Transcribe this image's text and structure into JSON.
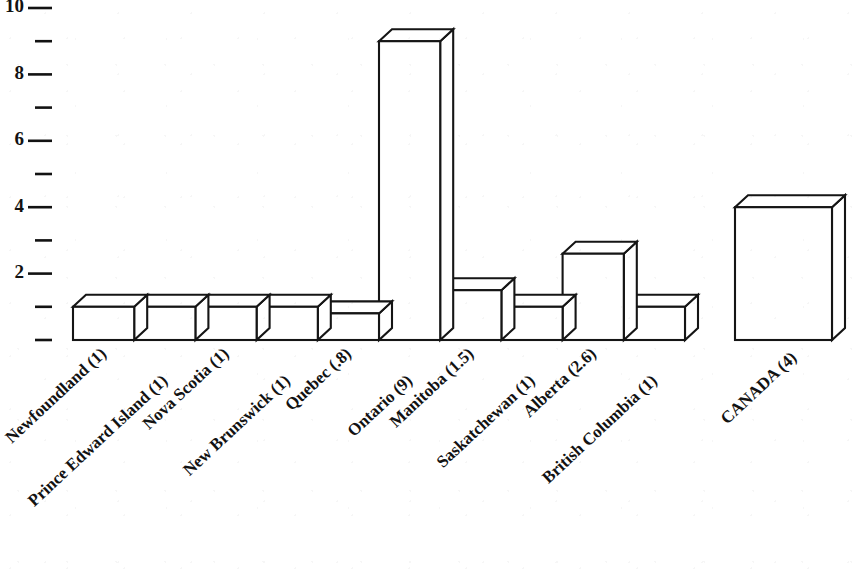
{
  "chart_data": {
    "type": "bar",
    "title": "",
    "xlabel": "",
    "ylabel": "",
    "ylim": [
      0,
      10
    ],
    "grid": false,
    "legend": null,
    "style": "3d-isometric-line-art",
    "categories": [
      "Newfoundland (1)",
      "Prince Edward Island (1)",
      "Nova Scotia (1)",
      "New Brunswick (1)",
      "Quebec (.8)",
      "Ontario (9)",
      "Manitoba (1.5)",
      "Saskatchewan (1)",
      "Alberta (2.6)",
      "British Columbia (1)",
      "CANADA (4)"
    ],
    "values": [
      1,
      1,
      1,
      1,
      0.8,
      9,
      1.5,
      1,
      2.6,
      1,
      4
    ],
    "series": [
      {
        "name": "value",
        "values": [
          1,
          1,
          1,
          1,
          0.8,
          9,
          1.5,
          1,
          2.6,
          1,
          4
        ]
      }
    ],
    "y_axis": {
      "min": 0,
      "max": 10,
      "major_ticks": [
        0,
        2,
        4,
        6,
        8,
        10
      ],
      "major_tick_labels": [
        "",
        "2",
        "4",
        "6",
        "8",
        "10"
      ],
      "minor_ticks": [
        1,
        3,
        5,
        7,
        9
      ],
      "labelled_ticks": [
        {
          "value": 10,
          "label": "10"
        },
        {
          "value": 8,
          "label": "8"
        },
        {
          "value": 6,
          "label": "6"
        },
        {
          "value": 4,
          "label": "4"
        },
        {
          "value": 2,
          "label": "2"
        }
      ]
    },
    "notes": {
      "grouping": "Ten provinces form one contiguous block of bars; CANADA is a separate wider bar at right.",
      "colors": {
        "bar_fill": "#ffffff",
        "bar_outline": "#151515",
        "background": "#ffffff",
        "text": "#121212"
      }
    }
  },
  "axis": {
    "tick_labels": [
      "10",
      "8",
      "6",
      "4",
      "2"
    ]
  },
  "labels": {
    "items": [
      "Newfoundland (1)",
      "Prince Edward Island (1)",
      "Nova Scotia (1)",
      "New Brunswick (1)",
      "Quebec (.8)",
      "Ontario (9)",
      "Manitoba (1.5)",
      "Saskatchewan (1)",
      "Alberta (2.6)",
      "British Columbia (1)",
      "CANADA (4)"
    ]
  }
}
